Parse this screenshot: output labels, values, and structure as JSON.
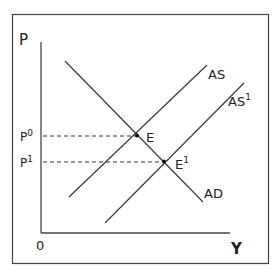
{
  "diagram": {
    "axes": {
      "y_label": "P",
      "x_label": "Y",
      "origin_label": "0"
    },
    "price_labels": [
      {
        "base": "P",
        "sup": "0"
      },
      {
        "base": "P",
        "sup": "1"
      }
    ],
    "curves": [
      {
        "id": "AS",
        "label": "AS",
        "sup": ""
      },
      {
        "id": "AS1",
        "label": "AS",
        "sup": "1"
      },
      {
        "id": "AD",
        "label": "AD",
        "sup": ""
      }
    ],
    "equilibria": [
      {
        "label": "E",
        "sup": ""
      },
      {
        "label": "E",
        "sup": "1"
      }
    ],
    "colors": {
      "line": "#333333",
      "frame": "#444444"
    }
  }
}
